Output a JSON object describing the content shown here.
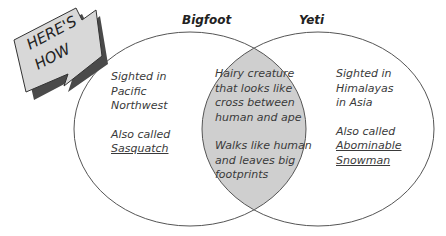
{
  "badge": {
    "line1": "HERE'S",
    "line2": "HOW"
  },
  "sets": [
    {
      "label": "Bigfoot",
      "lines1": [
        "Sighted in",
        "Pacific",
        "Northwest"
      ],
      "lines2": [
        "Also called"
      ],
      "alias": [
        "Sasquatch"
      ]
    },
    {
      "label": "Yeti",
      "lines1": [
        "Sighted in",
        "Himalayas",
        "in Asia"
      ],
      "lines2": [
        "Also called"
      ],
      "alias": [
        "Abominable",
        "Snowman"
      ]
    }
  ],
  "overlap": {
    "lines1": [
      "Hairy creature",
      "that looks like",
      "cross between",
      "human and ape"
    ],
    "lines2": [
      "Walks like human",
      "and leaves big",
      "footprints"
    ]
  },
  "colors": {
    "overlap_fill": "#cfcfcf",
    "stroke": "#555555",
    "badge_fill": "#d8d8d8",
    "badge_shadow": "#4a4a4a"
  }
}
